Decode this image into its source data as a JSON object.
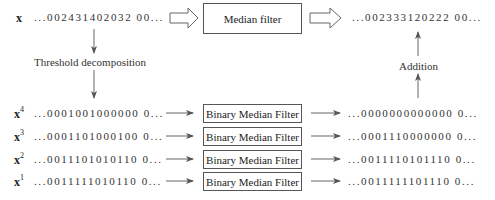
{
  "top": {
    "input_var": "x",
    "input_sequence": "...002431402032 00...",
    "filter_label": "Median filter",
    "output_sequence": "...002333120222 00..."
  },
  "labels": {
    "decomposition": "Threshold decomposition",
    "addition": "Addition"
  },
  "rows": [
    {
      "var": "x",
      "sup": "4",
      "input": "...0001001000000 0...",
      "filter": "Binary Median Filter",
      "output": "...0000000000000 0..."
    },
    {
      "var": "x",
      "sup": "3",
      "input": "...0001101000100 0...",
      "filter": "Binary Median Filter",
      "output": "...0001110000000 0..."
    },
    {
      "var": "x",
      "sup": "2",
      "input": "...0011101010110 0...",
      "filter": "Binary Median Filter",
      "output": "...0011110101110 0..."
    },
    {
      "var": "x",
      "sup": "1",
      "input": "...0011111010110 0...",
      "filter": "Binary Median Filter",
      "output": "...0011111101110 0..."
    }
  ]
}
